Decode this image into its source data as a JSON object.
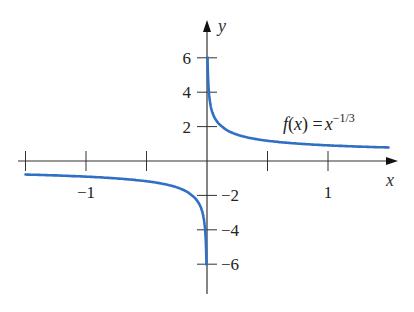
{
  "chart_data": {
    "type": "line",
    "title": "",
    "function": "f(x) = x^(-1/3)",
    "xlabel": "x",
    "ylabel": "y",
    "xlim": [
      -1.5,
      1.6
    ],
    "ylim": [
      -7,
      7.5
    ],
    "grid": false,
    "x_ticks": [
      -1.5,
      -1,
      -0.5,
      0.5,
      1
    ],
    "x_tick_labels": [
      {
        "value": -1,
        "label": "−1"
      },
      {
        "value": 1,
        "label": "1"
      }
    ],
    "y_ticks": [
      6,
      4,
      2,
      -2,
      -4,
      -6
    ],
    "y_tick_labels": [
      {
        "value": 6,
        "label": "6"
      },
      {
        "value": 4,
        "label": "4"
      },
      {
        "value": 2,
        "label": "2"
      },
      {
        "value": -2,
        "label": "−2"
      },
      {
        "value": -4,
        "label": "−4"
      },
      {
        "value": -6,
        "label": "−6"
      }
    ],
    "series": [
      {
        "name": "f(x) = x^(-1/3), x>0",
        "color": "#2f6fc4",
        "x": [
          0.0046,
          0.01,
          0.02,
          0.05,
          0.1,
          0.2,
          0.3,
          0.5,
          0.75,
          1.0,
          1.25,
          1.5
        ],
        "y": [
          6.0,
          4.64,
          3.68,
          2.71,
          2.15,
          1.71,
          1.49,
          1.26,
          1.1,
          1.0,
          0.93,
          0.87
        ]
      },
      {
        "name": "f(x) = x^(-1/3), x<0",
        "color": "#2f6fc4",
        "x": [
          -1.5,
          -1.25,
          -1.0,
          -0.75,
          -0.5,
          -0.3,
          -0.2,
          -0.1,
          -0.05,
          -0.02,
          -0.01,
          -0.0046
        ],
        "y": [
          -0.87,
          -0.93,
          -1.0,
          -1.1,
          -1.26,
          -1.49,
          -1.71,
          -2.15,
          -2.71,
          -3.68,
          -4.64,
          -6.0
        ]
      }
    ],
    "annotations": [
      {
        "text": "f(x) = x^{−1/3}",
        "x": 1.0,
        "y": 1.6
      }
    ]
  },
  "labels": {
    "x_axis": "x",
    "y_axis": "y",
    "fn_f": "f",
    "fn_open": "(",
    "fn_x": "x",
    "fn_close": ") =",
    "fn_base": "x",
    "fn_exp": "−1/3"
  },
  "colors": {
    "curve": "#2f6fc4",
    "axis": "#333333"
  }
}
